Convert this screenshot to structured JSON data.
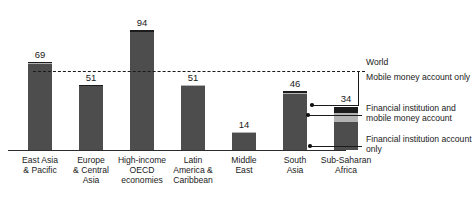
{
  "chart_data": {
    "type": "bar",
    "title": "",
    "subtitle": "",
    "xlabel": "",
    "ylabel": "",
    "ylim": [
      0,
      100
    ],
    "grid": false,
    "stacked": true,
    "legend_position": "right",
    "categories": [
      "East Asia\n& Pacific",
      "Europe\n& Central\nAsia",
      "High-income\nOECD\neconomies",
      "Latin\nAmerica &\nCaribbean",
      "Middle\nEast",
      "South\nAsia",
      "Sub-Saharan\nAfrica"
    ],
    "values": [
      69,
      51,
      94,
      51,
      14,
      46,
      34
    ],
    "value_labels": [
      "69",
      "51",
      "94",
      "51",
      "14",
      "46",
      "34"
    ],
    "series": [
      {
        "name": "Financial institution account only",
        "values": [
          67,
          50,
          92,
          50,
          13.5,
          44,
          22
        ]
      },
      {
        "name": "Financial institution and mobile money account",
        "values": [
          0.6,
          0.3,
          0.5,
          0.5,
          0.2,
          0.6,
          7
        ]
      },
      {
        "name": "Mobile money account only",
        "values": [
          1.4,
          0.7,
          1.5,
          0.5,
          0.3,
          1.4,
          5
        ]
      }
    ],
    "reference_line": {
      "label": "World",
      "value": 62,
      "style": "dashed"
    },
    "annotations": [
      "Mobile money account only",
      "Financial institution and mobile money account",
      "Financial institution account only"
    ]
  },
  "legend": {
    "world": "World",
    "mobile_money_only": "Mobile money\naccount only",
    "fi_and_mobile": "Financial institution\nand mobile money\naccount",
    "fi_only": "Financial institution\naccount only"
  },
  "colors": {
    "financial_institution_only": "#4d4d4d",
    "financial_and_mobile": "#b3b3b3",
    "mobile_money_only": "#1c1c1c",
    "axis": "#2b2b2b",
    "text": "#1a1a1a",
    "background": "#ffffff"
  }
}
